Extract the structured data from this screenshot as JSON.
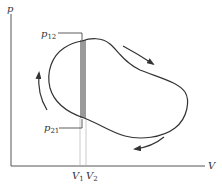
{
  "diagram": {
    "type": "pV-diagram",
    "axes": {
      "y_label": "p",
      "x_label": "V"
    },
    "labels": {
      "p12_base": "p",
      "p12_sub": "12",
      "p21_base": "p",
      "p21_sub": "21",
      "v1_base": "V",
      "v1_sub": "1",
      "v2_base": "V",
      "v2_sub": "2"
    },
    "cycle": {
      "direction": "clockwise",
      "arrows": [
        "top-right-down",
        "bottom-left",
        "left-up"
      ]
    },
    "colors": {
      "ink": "#333333",
      "strip": "#9a9a9a",
      "guide": "#b5b5b5"
    }
  }
}
